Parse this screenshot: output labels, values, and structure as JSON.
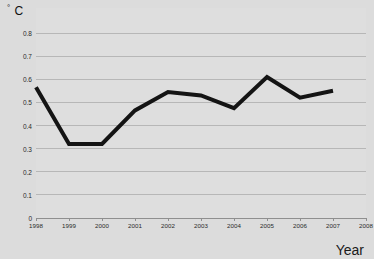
{
  "chart_data": {
    "type": "line",
    "title": "",
    "subtitle": "",
    "xlabel": "Year",
    "ylabel": "° C",
    "ylabel_degree": "°",
    "ylabel_unit": "C",
    "x": [
      1998,
      1999,
      2000,
      2001,
      2002,
      2003,
      2004,
      2005,
      2006,
      2007
    ],
    "categories": [
      "1998",
      "1999",
      "2000",
      "2001",
      "2002",
      "2003",
      "2004",
      "2005",
      "2006",
      "2007"
    ],
    "values": [
      0.565,
      0.32,
      0.32,
      0.465,
      0.545,
      0.53,
      0.475,
      0.61,
      0.52,
      0.55
    ],
    "series": [
      {
        "name": "temperature-anomaly",
        "values": [
          0.565,
          0.32,
          0.32,
          0.465,
          0.545,
          0.53,
          0.475,
          0.61,
          0.52,
          0.55
        ],
        "color": "#141414",
        "line_width": 4
      }
    ],
    "xlim": [
      1998,
      2008
    ],
    "ylim": [
      0,
      0.8
    ],
    "xticks": [
      1998,
      1999,
      2000,
      2001,
      2002,
      2003,
      2004,
      2005,
      2006,
      2007,
      2008
    ],
    "xtick_labels": [
      "1998",
      "1999",
      "2000",
      "2001",
      "2002",
      "2003",
      "2004",
      "2005",
      "2006",
      "2007",
      "2008"
    ],
    "yticks": [
      0,
      0.1,
      0.2,
      0.3,
      0.4,
      0.5,
      0.6,
      0.7,
      0.8
    ],
    "ytick_labels": [
      "0",
      "0.1",
      "0.2",
      "0.3",
      "0.4",
      "0.5",
      "0.6",
      "0.7",
      "0.8"
    ],
    "grid": true,
    "grid_axis": "y",
    "grid_color": "#b7b7b7",
    "legend": false,
    "legend_position": "none",
    "annotations": [],
    "markers": false
  },
  "figure": {
    "background_color": "#dcdcdc",
    "plot_background_color": "#dedede",
    "axis_color": "#8f8f8f",
    "text_color": "#2a2a2a"
  }
}
